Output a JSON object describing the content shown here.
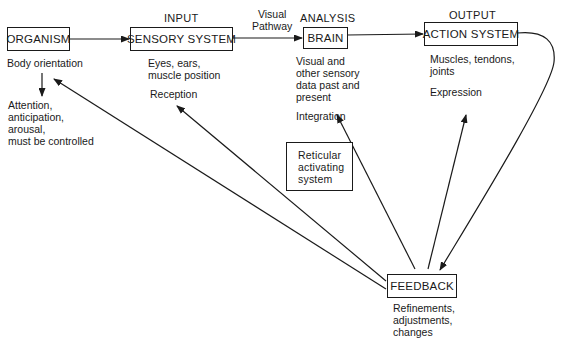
{
  "diagram": {
    "nodes": {
      "organism": {
        "label": "ORGANISM",
        "caption": "Body orientation",
        "note": "Attention,\nanticipation,\narousal,\nmust be controlled"
      },
      "sensory": {
        "stage": "INPUT",
        "label": "SENSORY SYSTEM",
        "caption": "Eyes, ears,\nmuscle position",
        "function": "Reception"
      },
      "brain": {
        "stage": "ANALYSIS",
        "label": "BRAIN",
        "caption": "Visual and\nother sensory\ndata past and\npresent",
        "function": "Integration"
      },
      "action": {
        "stage": "OUTPUT",
        "label": "ACTION SYSTEM",
        "caption": "Muscles, tendons,\njoints",
        "function": "Expression"
      },
      "reticular": {
        "label": "Reticular\nactivating\nsystem"
      },
      "feedback": {
        "label": "FEEDBACK",
        "caption": "Refinements,\nadjustments,\nchanges"
      }
    },
    "edge_labels": {
      "visual_pathway": "Visual\nPathway"
    },
    "edges": [
      {
        "from": "organism",
        "to": "sensory"
      },
      {
        "from": "sensory",
        "to": "brain",
        "label": "Visual Pathway"
      },
      {
        "from": "brain",
        "to": "action"
      },
      {
        "from": "action",
        "to": "feedback"
      },
      {
        "from": "feedback",
        "to": "organism"
      },
      {
        "from": "feedback",
        "to": "sensory"
      },
      {
        "from": "feedback",
        "to": "brain"
      },
      {
        "from": "feedback",
        "to": "action"
      },
      {
        "from": "organism",
        "to": "organism-note"
      }
    ],
    "colors": {
      "stroke": "#1a1a1a",
      "background": "#ffffff"
    }
  }
}
